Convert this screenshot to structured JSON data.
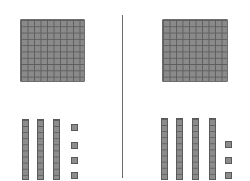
{
  "colors": {
    "block": "#8a8a8a",
    "grid_line": "#5e5e5e",
    "divider": "#6a6a6a",
    "background": "#ffffff"
  },
  "left_group": {
    "hundreds": 1,
    "tens": 3,
    "ones": 4,
    "value": 134
  },
  "right_group": {
    "hundreds": 1,
    "tens": 4,
    "ones": 3,
    "value": 143
  }
}
